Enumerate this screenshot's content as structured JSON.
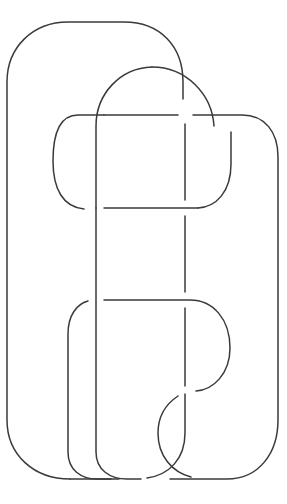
{
  "figure": {
    "title": "Knot diagram",
    "kind": "mathematical-knot-projection",
    "background_color": "#ffffff",
    "stroke_color": "#3a3a3c",
    "stroke_width": 1.5,
    "canvas": {
      "width": 287,
      "height": 504
    },
    "crossing_count": 8,
    "loops": [
      {
        "name": "outer-loop",
        "label": "outer rounded rectangle"
      },
      {
        "name": "middle-loop",
        "label": "middle rounded rectangle"
      },
      {
        "name": "inner-loop",
        "label": "inner rounded rectangle"
      }
    ],
    "strands": [
      {
        "name": "outer-loop-strand",
        "d": "M 70 479 C 30 479 7 456 7 421 L 7 80 C 7 45 30 22 65 22 L 124 22 C 160 22 183 45 183 80 L 183 99"
      },
      {
        "name": "middle-loop-top-left-arc",
        "d": "M 96 207 L 96 125 C 96 92 119 69 152 68"
      },
      {
        "name": "middle-loop-top-right-arc",
        "d": "M 152 68 C 186 68 210 92 213 125"
      },
      {
        "name": "middle-loop-right-upper",
        "d": "M 231 130 L 231 160 C 231 190 214 207 196 208"
      },
      {
        "name": "inner-loop-left-cap",
        "d": "M 96 115 L 77 115 C 60 115 54 131 54 160 C 54 190 62 207 82 208"
      },
      {
        "name": "inner-loop-top-edge-left",
        "d": "M 96 115 L 178 115"
      },
      {
        "name": "inner-loop-top-edge-right",
        "d": "M 193 115 L 242 115 C 264 115 278 130 278 155 L 278 421 C 278 452 260 479 228 479 L 168 479"
      },
      {
        "name": "middle-rail-left",
        "d": "M 96 208 L 96 300"
      },
      {
        "name": "middle-rail-left-lower",
        "d": "M 96 300 L 96 452 C 96 470 110 479 128 479 L 140 479"
      },
      {
        "name": "middle-horizontal-upper",
        "d": "M 104 208 L 196 208"
      },
      {
        "name": "inner-rail-right-upper",
        "d": "M 185 125 L 185 200"
      },
      {
        "name": "inner-rail-right-mid",
        "d": "M 185 216 L 185 292"
      },
      {
        "name": "lower-horizontal",
        "d": "M 104 300 L 190 300 C 212 300 229 318 229 348 C 229 373 212 390 195 391"
      },
      {
        "name": "inner-rail-right-lower",
        "d": "M 185 308 L 185 385"
      },
      {
        "name": "lower-left-hook",
        "d": "M 88 300 C 78 302 68 313 68 332 L 68 452 C 68 470 82 479 98 479 L 110 479"
      },
      {
        "name": "lower-swirl-left",
        "d": "M 178 395 C 166 403 158 414 158 432 C 158 455 172 471 190 476"
      },
      {
        "name": "bottom-curve-right",
        "d": "M 185 393 L 185 432 C 185 458 170 474 148 478"
      },
      {
        "name": "bottom-left-outer-tail",
        "d": "M 70 479 L 118 479"
      }
    ]
  }
}
